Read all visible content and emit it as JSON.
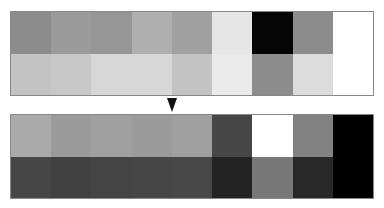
{
  "arrow": {
    "direction": "down",
    "icon": "down-triangle"
  },
  "grids": {
    "top": {
      "rows": [
        [
          "#8c8c8c",
          "#9b9b9b",
          "#969696",
          "#afafaf",
          "#a0a0a0",
          "#e6e6e6",
          "#050505",
          "#8c8c8c",
          "#ffffff"
        ],
        [
          "#c3c3c3",
          "#c8c8c8",
          "#d7d7d7",
          "#d7d7d7",
          "#c3c3c3",
          "#ebebeb",
          "#8c8c8c",
          "#dcdcdc",
          "#ffffff"
        ]
      ]
    },
    "bottom": {
      "rows": [
        [
          "#aaaaaa",
          "#9b9b9b",
          "#a0a0a0",
          "#9b9b9b",
          "#a0a0a0",
          "#464646",
          "#ffffff",
          "#828282",
          "#000000"
        ],
        [
          "#464646",
          "#414141",
          "#444444",
          "#464646",
          "#484848",
          "#232323",
          "#787878",
          "#282828",
          "#000000"
        ]
      ]
    }
  }
}
